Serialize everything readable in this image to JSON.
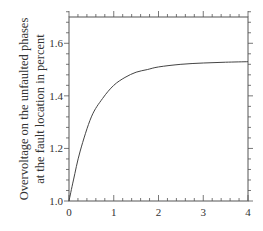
{
  "chart_data": {
    "type": "line",
    "title": "",
    "xlabel": "",
    "ylabel": [
      "Overvoltage on the unfaulted phases",
      "at the fault location in percent"
    ],
    "xlim": [
      0,
      4
    ],
    "ylim": [
      1.0,
      1.7
    ],
    "x_ticks": [
      "0",
      "1",
      "2",
      "3",
      "4"
    ],
    "y_ticks": [
      "1.0",
      "1.2",
      "1.4",
      "1.6"
    ],
    "grid": false,
    "legend": null,
    "series": [
      {
        "name": "overvoltage",
        "x": [
          0,
          0.1,
          0.25,
          0.5,
          0.75,
          1.0,
          1.25,
          1.5,
          1.75,
          2.0,
          2.5,
          3.0,
          3.5,
          4.0
        ],
        "y": [
          1.0,
          1.08,
          1.19,
          1.32,
          1.39,
          1.44,
          1.47,
          1.49,
          1.5,
          1.51,
          1.52,
          1.525,
          1.528,
          1.53
        ]
      }
    ],
    "colors": {
      "line": "#444444",
      "axis": "#555555"
    }
  }
}
